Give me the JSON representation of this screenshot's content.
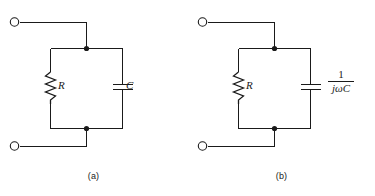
{
  "figure": {
    "kind": "circuit-diagram",
    "background_color": "#ffffff",
    "line_color": "#1a1a1a",
    "panels": [
      {
        "id": "a",
        "caption": "(a)",
        "components": [
          {
            "ref": "resistor",
            "symbol": "zigzag-resistor",
            "label": "R"
          },
          {
            "ref": "capacitor",
            "symbol": "parallel-plate-capacitor",
            "label": "C"
          }
        ],
        "terminals": [
          {
            "name": "top-terminal",
            "marker": "open-circle"
          },
          {
            "name": "bottom-terminal",
            "marker": "open-circle"
          }
        ],
        "junctions": [
          {
            "name": "top-node",
            "marker": "filled-dot"
          },
          {
            "name": "bottom-node",
            "marker": "filled-dot"
          }
        ]
      },
      {
        "id": "b",
        "caption": "(b)",
        "components": [
          {
            "ref": "resistor",
            "symbol": "zigzag-resistor",
            "label": "R"
          },
          {
            "ref": "capacitor",
            "symbol": "parallel-plate-capacitor",
            "label_numerator": "1",
            "label_denominator": "jωC"
          }
        ],
        "terminals": [
          {
            "name": "top-terminal",
            "marker": "open-circle"
          },
          {
            "name": "bottom-terminal",
            "marker": "open-circle"
          }
        ],
        "junctions": [
          {
            "name": "top-node",
            "marker": "filled-dot"
          },
          {
            "name": "bottom-node",
            "marker": "filled-dot"
          }
        ]
      }
    ]
  }
}
